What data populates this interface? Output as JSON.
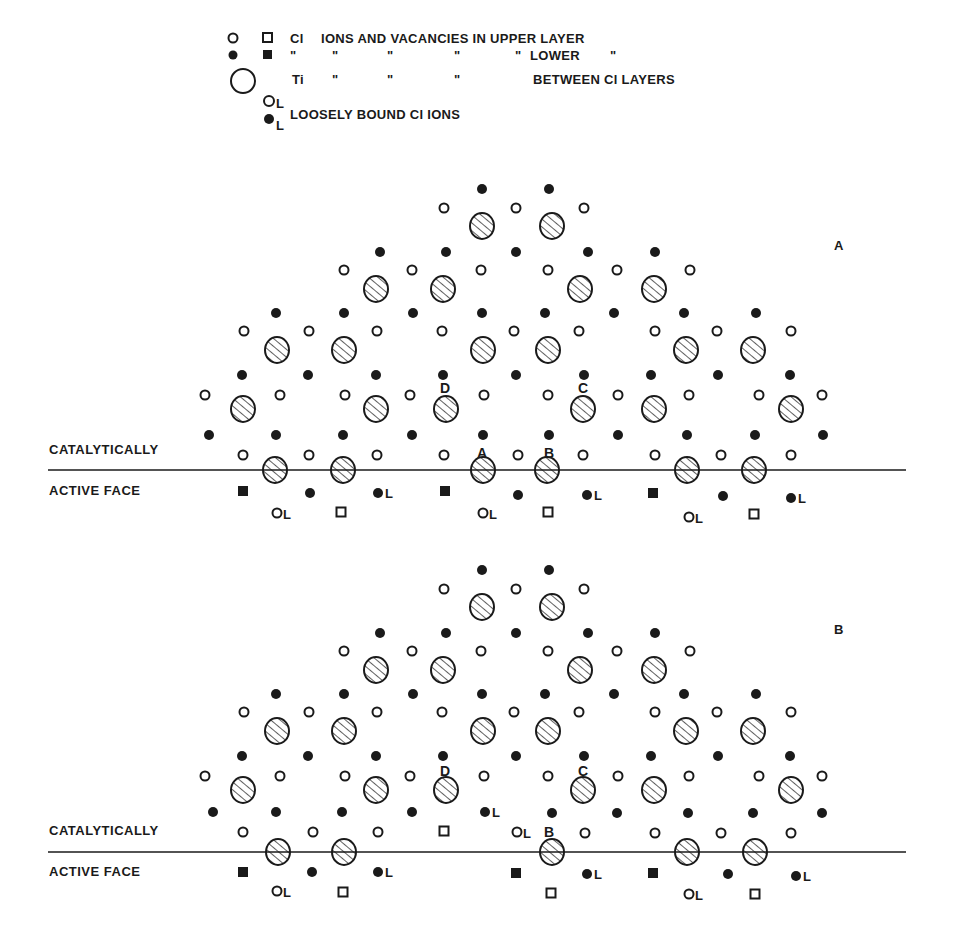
{
  "legend": {
    "rows": [
      {
        "symbols": [
          "open-circle",
          "open-square"
        ],
        "text": "Cl  IONS  AND VACANCIES IN UPPER LAYER"
      },
      {
        "symbols": [
          "filled-circle",
          "filled-square"
        ],
        "text": "\"      \"        \"          \"        \" LOWER   \""
      },
      {
        "symbols": [
          "large-circle"
        ],
        "text": "Ti      \"        \"          \"             BETWEEN Cl LAYERS"
      },
      {
        "symbols": [
          "open-circle-L",
          "filled-circle-L"
        ],
        "text": "LOOSELY BOUND Cl IONS"
      }
    ],
    "row1_prefix": "Cl",
    "row1_main": "IONS  AND VACANCIES IN UPPER LAYER",
    "row2_ditto": "\"",
    "row2_suffix": "LOWER",
    "row3_prefix": "Ti",
    "row3_suffix": "BETWEEN Cl LAYERS",
    "row4_text": "LOOSELY BOUND Cl IONS",
    "L": "L"
  },
  "panels": [
    {
      "id": "A",
      "panel_label": "A",
      "face_label_top": "CATALYTICALLY",
      "face_label_bottom": "ACTIVE FACE",
      "site_labels": {
        "A": "A",
        "B": "B",
        "C": "C",
        "D": "D"
      }
    },
    {
      "id": "B",
      "panel_label": "B",
      "face_label_top": "CATALYTICALLY",
      "face_label_bottom": "ACTIVE FACE",
      "site_labels": {
        "B": "B",
        "C": "C",
        "D": "D"
      }
    }
  ],
  "colors": {
    "ink": "#1a1a1a",
    "background": "#ffffff"
  }
}
